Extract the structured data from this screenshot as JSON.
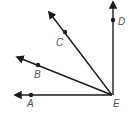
{
  "diagram": {
    "type": "rays-from-common-vertex",
    "vertex": {
      "label": "E",
      "x": 112,
      "y": 95
    },
    "rays": [
      {
        "name": "EA",
        "point_label": "A",
        "tip": [
          13,
          95
        ],
        "dot": [
          31,
          95
        ],
        "label_pos": [
          27,
          107
        ]
      },
      {
        "name": "EB",
        "point_label": "B",
        "tip": [
          15,
          56
        ],
        "dot": [
          38,
          65
        ],
        "label_pos": [
          34,
          78
        ]
      },
      {
        "name": "EC",
        "point_label": "C",
        "tip": [
          48,
          10
        ],
        "dot": [
          65,
          32
        ],
        "label_pos": [
          56,
          46
        ]
      },
      {
        "name": "ED",
        "point_label": "D",
        "tip": [
          113,
          0
        ],
        "dot": [
          113,
          20
        ],
        "label_pos": [
          118,
          25
        ]
      }
    ],
    "labels": {
      "A": "A",
      "B": "B",
      "C": "C",
      "D": "D",
      "E": "E"
    },
    "colors": {
      "line": "#1a1a1a",
      "label": "#555555",
      "background": "#ffffff"
    }
  }
}
